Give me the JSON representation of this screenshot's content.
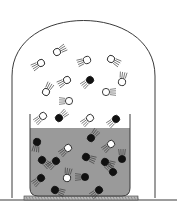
{
  "diagram": {
    "colors": {
      "background": "#ffffff",
      "outline": "#3a3a3a",
      "liquid": "#9a9a9a",
      "liquid_molecule": "#111111",
      "vapor_molecule": "#ffffff",
      "base_plate": "#b8b8b8"
    },
    "bell_jar": {
      "left": 12,
      "right": 155,
      "top": 6,
      "bottom": 198,
      "arc_height": 70
    },
    "beaker": {
      "left": 30,
      "right": 130,
      "top": 114,
      "bottom": 196,
      "liquid_top": 128
    },
    "base_plate": {
      "left": 24,
      "right": 138,
      "top": 196,
      "height": 4
    },
    "molecules": [
      {
        "x": 41,
        "y": 63,
        "filled": false,
        "angle": -30
      },
      {
        "x": 57,
        "y": 52,
        "filled": false,
        "angle": 150
      },
      {
        "x": 87,
        "y": 60,
        "filled": false,
        "angle": -20
      },
      {
        "x": 111,
        "y": 59,
        "filled": false,
        "angle": 210
      },
      {
        "x": 67,
        "y": 80,
        "filled": false,
        "angle": -30
      },
      {
        "x": 90,
        "y": 80,
        "filled": true,
        "angle": -40
      },
      {
        "x": 122,
        "y": 82,
        "filled": false,
        "angle": 100
      },
      {
        "x": 46,
        "y": 92,
        "filled": false,
        "angle": 120
      },
      {
        "x": 106,
        "y": 92,
        "filled": false,
        "angle": 180
      },
      {
        "x": 69,
        "y": 101,
        "filled": false,
        "angle": 0
      },
      {
        "x": 43,
        "y": 116,
        "filled": false,
        "angle": -40
      },
      {
        "x": 59,
        "y": 118,
        "filled": true,
        "angle": 140
      },
      {
        "x": 90,
        "y": 118,
        "filled": false,
        "angle": -40
      },
      {
        "x": 116,
        "y": 119,
        "filled": true,
        "angle": -40
      },
      {
        "x": 37,
        "y": 142,
        "filled": true,
        "angle": -80
      },
      {
        "x": 68,
        "y": 148,
        "filled": false,
        "angle": -40
      },
      {
        "x": 91,
        "y": 138,
        "filled": true,
        "angle": 130
      },
      {
        "x": 111,
        "y": 144,
        "filled": false,
        "angle": -40
      },
      {
        "x": 42,
        "y": 160,
        "filled": true,
        "angle": -140
      },
      {
        "x": 56,
        "y": 161,
        "filled": true,
        "angle": -40
      },
      {
        "x": 86,
        "y": 157,
        "filled": true,
        "angle": 200
      },
      {
        "x": 105,
        "y": 162,
        "filled": true,
        "angle": 200
      },
      {
        "x": 122,
        "y": 159,
        "filled": true,
        "angle": 90
      },
      {
        "x": 41,
        "y": 178,
        "filled": true,
        "angle": -40
      },
      {
        "x": 67,
        "y": 178,
        "filled": false,
        "angle": 100
      },
      {
        "x": 85,
        "y": 177,
        "filled": true,
        "angle": 0
      },
      {
        "x": 113,
        "y": 172,
        "filled": true,
        "angle": 50
      },
      {
        "x": 55,
        "y": 190,
        "filled": true,
        "angle": 200
      },
      {
        "x": 99,
        "y": 190,
        "filled": true,
        "angle": -40
      }
    ]
  }
}
